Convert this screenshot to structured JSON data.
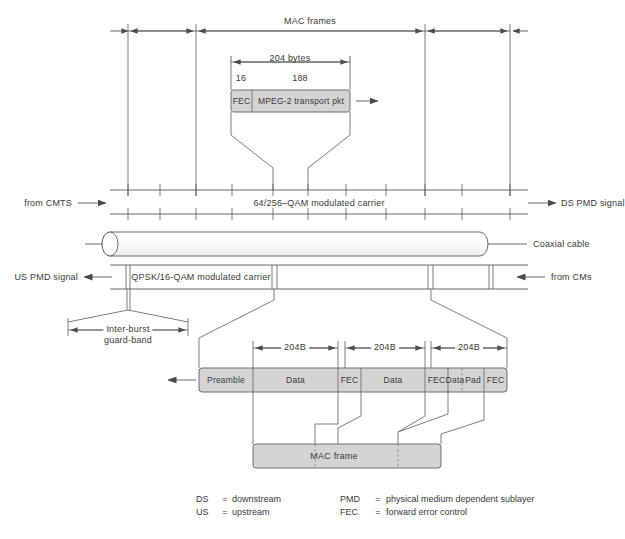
{
  "diagram": {
    "colors": {
      "line": "#555555",
      "box_fill": "#d4d4d4",
      "box_stroke": "#6f6f6f",
      "text": "#3a3a3a",
      "cable_fill": "#ffffff"
    },
    "top": {
      "mac_frames_label": "MAC frames",
      "bytes_label": "204 bytes",
      "fec_size": "16",
      "payload_size": "188"
    },
    "mpeg_packet": {
      "fec_label": "FEC",
      "payload_label": "MPEG-2 transport pkt"
    },
    "downstream": {
      "from_label": "from CMTS",
      "carrier_label": "64/256–QAM modulated carrier",
      "signal_label": "DS PMD signal"
    },
    "cable": {
      "label": "Coaxial cable"
    },
    "upstream": {
      "signal_label": "US PMD signal",
      "carrier_label": "QPSK/16-QAM modulated carrier",
      "from_label": "from CMs",
      "guard_band_line1": "Inter-burst",
      "guard_band_line2": "guard-band"
    },
    "burst": {
      "dim_labels": [
        "204B",
        "204B",
        "204B"
      ],
      "segments": [
        {
          "label": "Preamble"
        },
        {
          "label": "Data"
        },
        {
          "label": "FEC"
        },
        {
          "label": "Data"
        },
        {
          "label": "FEC"
        },
        {
          "label": "Data"
        },
        {
          "label": "Pad"
        },
        {
          "label": "FEC"
        }
      ]
    },
    "mac_frame": {
      "label": "MAC frame"
    },
    "legend": {
      "left": [
        {
          "key": "DS",
          "eq": "=",
          "value": "downstream"
        },
        {
          "key": "US",
          "eq": "=",
          "value": "upstream"
        }
      ],
      "right": [
        {
          "key": "PMD",
          "eq": "=",
          "value": "physical medium dependent sublayer"
        },
        {
          "key": "FEC",
          "eq": "=",
          "value": "forward error control"
        }
      ]
    }
  }
}
